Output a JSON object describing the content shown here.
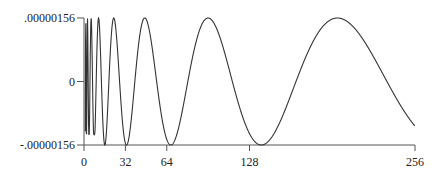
{
  "chart_data": {
    "type": "line",
    "title": "",
    "xlabel": "",
    "ylabel": "",
    "grid": false,
    "legend": null,
    "xlim": [
      0,
      256
    ],
    "ylim": [
      -1.56e-06,
      1.56e-06
    ],
    "x_ticks": [
      {
        "value": 0,
        "label": "0"
      },
      {
        "value": 32,
        "label": "32"
      },
      {
        "value": 64,
        "label": "64"
      },
      {
        "value": 128,
        "label": "128"
      },
      {
        "value": 256,
        "label": "256"
      }
    ],
    "y_ticks": [
      {
        "value": 1.56e-06,
        "label": ".00000156"
      },
      {
        "value": 0,
        "label": "0"
      },
      {
        "value": -1.56e-06,
        "label": "-.00000156"
      }
    ],
    "series": [
      {
        "name": "chirp",
        "description": "Oscillation periodic in log2(x), amplitude 0.00000156, period about one octave",
        "peaks_x": [
          47,
          98,
          196
        ],
        "troughs_x": [
          32,
          68,
          138
        ],
        "x": [
          1,
          2,
          3,
          4,
          6,
          8,
          12,
          16,
          20,
          24,
          28,
          32,
          40,
          47,
          56,
          64,
          68,
          80,
          90,
          98,
          110,
          120,
          138,
          160,
          180,
          196,
          210,
          230,
          256
        ],
        "y": [
          6.1e-07,
          -9.2e-07,
          1.5e-06,
          -1.48e-06,
          1.21e-06,
          -1.1e-06,
          1.4e-06,
          -6.8e-07,
          1.56e-06,
          -5e-08,
          -1.32e-06,
          -1.56e-06,
          9e-07,
          1.56e-06,
          5.8e-07,
          -1.32e-06,
          -1.56e-06,
          -6.2e-07,
          1.04e-06,
          1.56e-06,
          9.2e-07,
          -1.8e-07,
          -1.56e-06,
          -6e-07,
          1.17e-06,
          1.56e-06,
          1.27e-06,
          1e-07,
          -1.1e-06
        ]
      }
    ],
    "model": {
      "amplitude": 1.56e-06,
      "peak_ref_x": 196,
      "log2_period": 1.03
    }
  },
  "layout": {
    "plot_left_px": 84,
    "plot_right_px": 415,
    "plot_top_px": 18,
    "plot_bottom_px": 145,
    "zero_y_px": 81
  }
}
